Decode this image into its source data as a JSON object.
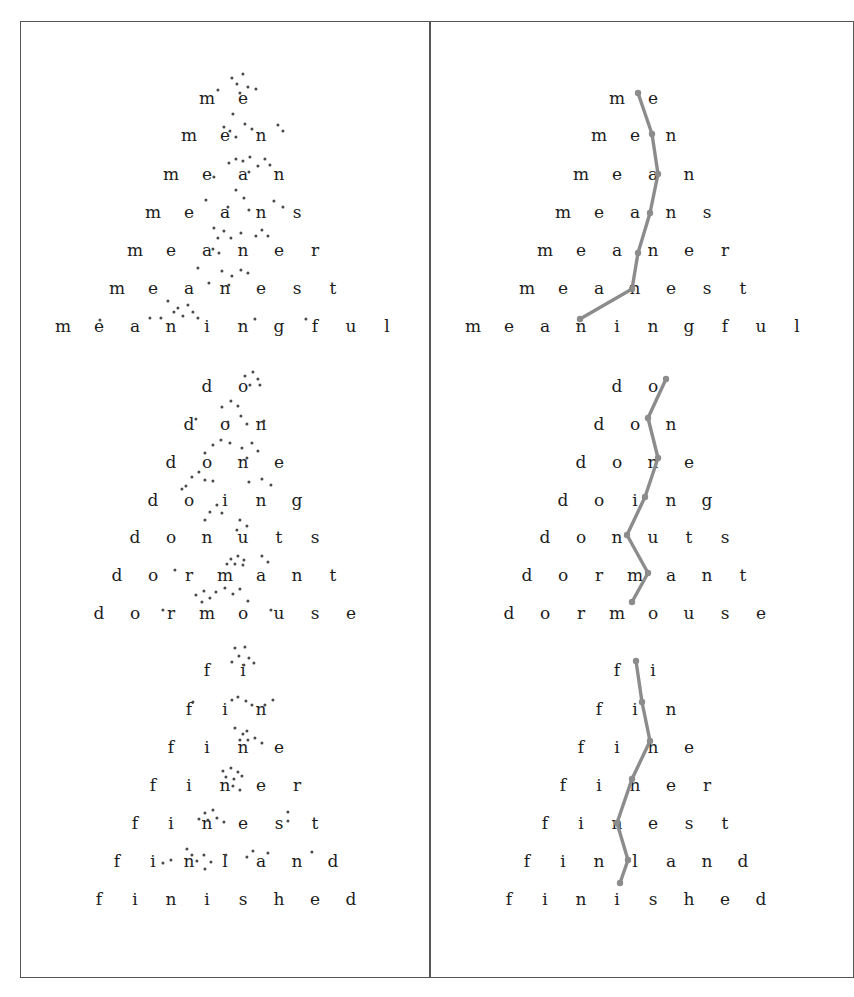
{
  "figure": {
    "title": "",
    "background": "#ffffff",
    "frame_color": "#555555",
    "text_color": "#1c1c1c",
    "dot_color": "#4a4a4a",
    "line_color": "#8c8c8c"
  },
  "panels": [
    {
      "id": "left",
      "label": "scatter-panel",
      "x": 20,
      "y": 21,
      "width": 410,
      "height": 957
    },
    {
      "id": "right",
      "label": "path-panel",
      "x": 430,
      "y": 21,
      "width": 424,
      "height": 957
    }
  ],
  "chart_data": {
    "type": "scatter",
    "title": "",
    "xlabel": "",
    "ylabel": "",
    "grid": false,
    "legend": null,
    "groups": [
      {
        "name": "meaning-group",
        "letter_spacing": 36,
        "row_height": 37,
        "first_row_y": 98,
        "rows": [
          {
            "word": "me",
            "y": 98,
            "center_x": 225
          },
          {
            "word": "men",
            "y": 135,
            "center_x": 225
          },
          {
            "word": "mean",
            "y": 174,
            "center_x": 225
          },
          {
            "word": "means",
            "y": 212,
            "center_x": 225
          },
          {
            "word": "meaner",
            "y": 250,
            "center_x": 225
          },
          {
            "word": "meanest",
            "y": 288,
            "center_x": 225
          },
          {
            "word": "meaningful",
            "y": 326,
            "center_x": 225
          }
        ],
        "mean_path_left": [
          [
            233,
            98
          ],
          [
            247,
            135
          ],
          [
            253,
            174
          ],
          [
            245,
            212
          ],
          [
            233,
            250
          ],
          [
            227,
            288
          ],
          [
            175,
            326
          ]
        ],
        "mean_path_right": [
          [
            638,
            93
          ],
          [
            652,
            134
          ],
          [
            658,
            174
          ],
          [
            650,
            213
          ],
          [
            638,
            253
          ],
          [
            632,
            289
          ],
          [
            580,
            319
          ]
        ],
        "scatter_points": [
          [
            232,
            78
          ],
          [
            243,
            74
          ],
          [
            237,
            84
          ],
          [
            248,
            87
          ],
          [
            218,
            90
          ],
          [
            256,
            89
          ],
          [
            240,
            93
          ],
          [
            233,
            114
          ],
          [
            224,
            127
          ],
          [
            245,
            124
          ],
          [
            230,
            131
          ],
          [
            236,
            137
          ],
          [
            252,
            129
          ],
          [
            278,
            125
          ],
          [
            283,
            131
          ],
          [
            236,
            159
          ],
          [
            229,
            163
          ],
          [
            243,
            161
          ],
          [
            250,
            157
          ],
          [
            258,
            166
          ],
          [
            265,
            159
          ],
          [
            270,
            165
          ],
          [
            249,
            172
          ],
          [
            214,
            177
          ],
          [
            236,
            190
          ],
          [
            206,
            200
          ],
          [
            244,
            198
          ],
          [
            228,
            207
          ],
          [
            249,
            210
          ],
          [
            274,
            201
          ],
          [
            283,
            207
          ],
          [
            214,
            228
          ],
          [
            224,
            231
          ],
          [
            218,
            238
          ],
          [
            231,
            238
          ],
          [
            241,
            233
          ],
          [
            256,
            236
          ],
          [
            262,
            230
          ],
          [
            268,
            236
          ],
          [
            213,
            249
          ],
          [
            219,
            253
          ],
          [
            198,
            268
          ],
          [
            222,
            271
          ],
          [
            232,
            276
          ],
          [
            241,
            270
          ],
          [
            248,
            273
          ],
          [
            209,
            283
          ],
          [
            229,
            285
          ],
          [
            168,
            301
          ],
          [
            178,
            308
          ],
          [
            188,
            305
          ],
          [
            174,
            312
          ],
          [
            183,
            316
          ],
          [
            193,
            312
          ],
          [
            161,
            318
          ],
          [
            198,
            318
          ],
          [
            100,
            320
          ],
          [
            150,
            318
          ],
          [
            255,
            319
          ],
          [
            306,
            319
          ]
        ]
      },
      {
        "name": "dormouse-group",
        "letter_spacing": 36,
        "row_height": 38,
        "first_row_y": 386,
        "rows": [
          {
            "word": "do",
            "y": 386,
            "center_x": 225
          },
          {
            "word": "don",
            "y": 424,
            "center_x": 225
          },
          {
            "word": "done",
            "y": 462,
            "center_x": 225
          },
          {
            "word": "doing",
            "y": 500,
            "center_x": 225
          },
          {
            "word": "donuts",
            "y": 537,
            "center_x": 225
          },
          {
            "word": "dormant",
            "y": 575,
            "center_x": 225
          },
          {
            "word": "dormouse",
            "y": 613,
            "center_x": 225
          }
        ],
        "mean_path_right": [
          [
            666,
            379
          ],
          [
            648,
            418
          ],
          [
            658,
            458
          ],
          [
            645,
            497
          ],
          [
            627,
            535
          ],
          [
            648,
            573
          ],
          [
            632,
            602
          ]
        ],
        "scatter_points": [
          [
            245,
            376
          ],
          [
            253,
            372
          ],
          [
            258,
            379
          ],
          [
            250,
            385
          ],
          [
            260,
            385
          ],
          [
            222,
            407
          ],
          [
            231,
            401
          ],
          [
            238,
            406
          ],
          [
            196,
            419
          ],
          [
            228,
            422
          ],
          [
            241,
            416
          ],
          [
            247,
            424
          ],
          [
            264,
            421
          ],
          [
            213,
            445
          ],
          [
            221,
            440
          ],
          [
            230,
            443
          ],
          [
            205,
            453
          ],
          [
            242,
            448
          ],
          [
            252,
            443
          ],
          [
            258,
            451
          ],
          [
            247,
            458
          ],
          [
            192,
            477
          ],
          [
            199,
            472
          ],
          [
            205,
            480
          ],
          [
            186,
            486
          ],
          [
            213,
            481
          ],
          [
            249,
            482
          ],
          [
            262,
            479
          ],
          [
            271,
            485
          ],
          [
            182,
            489
          ],
          [
            217,
            505
          ],
          [
            210,
            512
          ],
          [
            222,
            513
          ],
          [
            205,
            520
          ],
          [
            240,
            520
          ],
          [
            247,
            526
          ],
          [
            237,
            530
          ],
          [
            231,
            559
          ],
          [
            238,
            556
          ],
          [
            244,
            560
          ],
          [
            227,
            564
          ],
          [
            235,
            564
          ],
          [
            243,
            565
          ],
          [
            262,
            556
          ],
          [
            268,
            562
          ],
          [
            175,
            570
          ],
          [
            196,
            595
          ],
          [
            204,
            591
          ],
          [
            210,
            598
          ],
          [
            216,
            592
          ],
          [
            225,
            588
          ],
          [
            233,
            594
          ],
          [
            240,
            589
          ],
          [
            202,
            602
          ],
          [
            248,
            601
          ],
          [
            163,
            610
          ],
          [
            271,
            610
          ]
        ]
      },
      {
        "name": "finished-group",
        "letter_spacing": 36,
        "row_height": 38,
        "first_row_y": 670,
        "rows": [
          {
            "word": "fi",
            "y": 670,
            "center_x": 225
          },
          {
            "word": "fin",
            "y": 709,
            "center_x": 225
          },
          {
            "word": "fine",
            "y": 747,
            "center_x": 225
          },
          {
            "word": "finer",
            "y": 785,
            "center_x": 225
          },
          {
            "word": "finest",
            "y": 823,
            "center_x": 225
          },
          {
            "word": "finland",
            "y": 861,
            "center_x": 225
          },
          {
            "word": "finished",
            "y": 899,
            "center_x": 225
          }
        ],
        "mean_path_right": [
          [
            636,
            661
          ],
          [
            642,
            702
          ],
          [
            650,
            741
          ],
          [
            632,
            779
          ],
          [
            617,
            823
          ],
          [
            628,
            860
          ],
          [
            620,
            883
          ]
        ],
        "scatter_points": [
          [
            235,
            648
          ],
          [
            245,
            647
          ],
          [
            239,
            656
          ],
          [
            249,
            658
          ],
          [
            232,
            662
          ],
          [
            244,
            665
          ],
          [
            254,
            663
          ],
          [
            232,
            700
          ],
          [
            238,
            697
          ],
          [
            246,
            701
          ],
          [
            252,
            705
          ],
          [
            193,
            702
          ],
          [
            265,
            705
          ],
          [
            273,
            700
          ],
          [
            235,
            728
          ],
          [
            243,
            734
          ],
          [
            247,
            731
          ],
          [
            240,
            740
          ],
          [
            248,
            740
          ],
          [
            255,
            738
          ],
          [
            262,
            743
          ],
          [
            223,
            771
          ],
          [
            231,
            768
          ],
          [
            238,
            772
          ],
          [
            226,
            777
          ],
          [
            234,
            779
          ],
          [
            242,
            776
          ],
          [
            233,
            786
          ],
          [
            240,
            790
          ],
          [
            205,
            813
          ],
          [
            213,
            810
          ],
          [
            199,
            819
          ],
          [
            208,
            820
          ],
          [
            217,
            818
          ],
          [
            224,
            822
          ],
          [
            288,
            812
          ],
          [
            288,
            821
          ],
          [
            187,
            849
          ],
          [
            192,
            855
          ],
          [
            226,
            855
          ],
          [
            253,
            851
          ],
          [
            312,
            852
          ],
          [
            163,
            863
          ],
          [
            171,
            860
          ],
          [
            204,
            855
          ],
          [
            197,
            861
          ],
          [
            211,
            862
          ],
          [
            247,
            857
          ],
          [
            268,
            853
          ],
          [
            205,
            869
          ]
        ]
      }
    ]
  }
}
